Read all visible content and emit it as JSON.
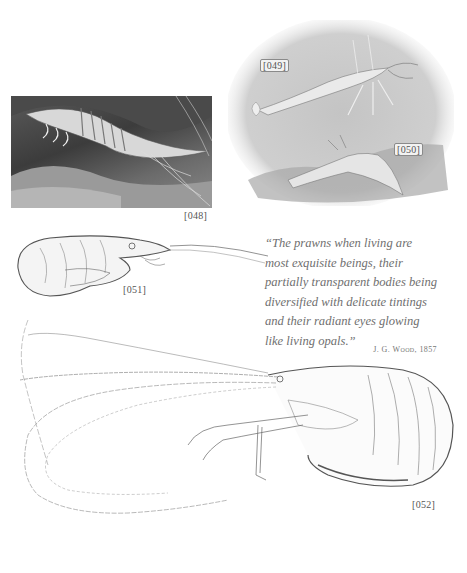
{
  "page": {
    "background": "#ffffff"
  },
  "plates": [
    {
      "id": "048",
      "label": "[048]",
      "description": "engraving-shrimp-among-seaweed",
      "style": "dark-rectangular"
    },
    {
      "id": "049",
      "label": "[049]",
      "description": "engraving-prawn-swimming",
      "style": "oval-vignette"
    },
    {
      "id": "050",
      "label": "[050]",
      "description": "engraving-prawn-on-rock",
      "style": "oval-vignette"
    },
    {
      "id": "051",
      "label": "[051]",
      "description": "line-drawing-shrimp-curled",
      "style": "line-art"
    },
    {
      "id": "052",
      "label": "[052]",
      "description": "line-drawing-prawn-long-antennae",
      "style": "line-art"
    }
  ],
  "quote": {
    "lines": [
      "“The prawns when living are",
      "most exquisite beings, their",
      "partially transparent bodies being",
      "diversified with delicate tintings",
      "and their radiant eyes glowing",
      "like living opals.”"
    ],
    "attribution": "J. G. Wood, 1857"
  },
  "colors": {
    "text": "#6f6f6f",
    "engraving_dark": "#3c3c3c",
    "engraving_light": "#bdbdbd",
    "line_art": "#555555"
  }
}
